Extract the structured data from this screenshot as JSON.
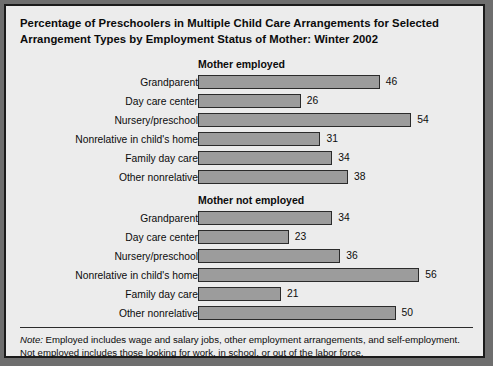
{
  "title": "Percentage of Preschoolers in Multiple Child Care Arrangements for Selected Arrangement Types by Employment Status of Mother: Winter 2002",
  "note": {
    "label": "Note:",
    "line1": " Employed includes wage and salary jobs, other employment arrangements, and self-employment.",
    "line2": "Not employed includes those looking for work, in school, or out of the labor force."
  },
  "colors": {
    "bar_fill": "#9c9c9c",
    "bar_border": "#2b2b2b",
    "panel_background": "#ececec",
    "frame_border": "#1b1b1b",
    "text": "#0b0b0b"
  },
  "chart_data": {
    "type": "bar",
    "orientation": "horizontal",
    "title": "Percentage of Preschoolers in Multiple Child Care Arrangements for Selected Arrangement Types by Employment Status of Mother: Winter 2002",
    "xlabel": "",
    "ylabel": "",
    "xlim": [
      0,
      60
    ],
    "grid": false,
    "legend": "none",
    "value_labels": true,
    "categories": [
      "Grandparent",
      "Day care center",
      "Nursery/preschool",
      "Nonrelative in child's home",
      "Family day care",
      "Other nonrelative"
    ],
    "groups": [
      {
        "name": "Mother employed",
        "categories": [
          "Grandparent",
          "Day care center",
          "Nursery/preschool",
          "Nonrelative in child's home",
          "Family day care",
          "Other nonrelative"
        ],
        "values": [
          46,
          26,
          54,
          31,
          34,
          38
        ]
      },
      {
        "name": "Mother not employed",
        "categories": [
          "Grandparent",
          "Day care center",
          "Nursery/preschool",
          "Nonrelative in child's home",
          "Family day care",
          "Other nonrelative"
        ],
        "values": [
          34,
          23,
          36,
          56,
          21,
          50
        ]
      }
    ]
  }
}
